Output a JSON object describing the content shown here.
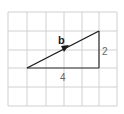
{
  "diagram": {
    "grid": {
      "x_lines": [
        8,
        27,
        46,
        64,
        82,
        99,
        117
      ],
      "y_lines": [
        12,
        31,
        50,
        68,
        87,
        106
      ],
      "color": "#d0d0d0"
    },
    "vector": {
      "label": "b",
      "from": [
        27,
        68
      ],
      "to": [
        99,
        31
      ],
      "color": "#1a1a1a"
    },
    "legs": {
      "horizontal_label": "4",
      "vertical_label": "2",
      "color": "#333333",
      "label_color": "#666666"
    }
  }
}
